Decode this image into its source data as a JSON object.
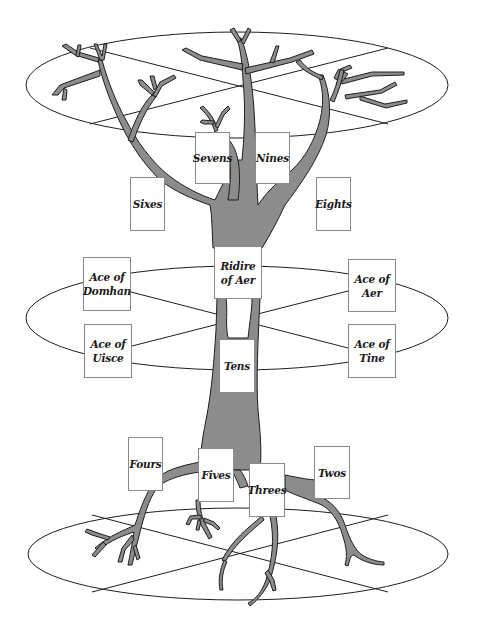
{
  "diagram": {
    "type": "tree-of-life-tarot-layout",
    "colors": {
      "tree_fill": "#8c8c8c",
      "tree_stroke": "#1e1e1e",
      "line": "#1e1e1e",
      "card_border": "#8a8a8a",
      "background": "#ffffff"
    },
    "planes": [
      {
        "name": "upper-plane",
        "cx": 237,
        "cy": 85,
        "rx": 211,
        "ry": 54
      },
      {
        "name": "middle-plane",
        "cx": 237,
        "cy": 318,
        "rx": 211,
        "ry": 53
      },
      {
        "name": "lower-plane",
        "cx": 238,
        "cy": 555,
        "rx": 210,
        "ry": 47
      }
    ],
    "cards": {
      "sevens": {
        "label": "Sevens",
        "x": 195,
        "y": 132,
        "w": 35,
        "h": 52
      },
      "nines": {
        "label": "Nines",
        "x": 255,
        "y": 132,
        "w": 35,
        "h": 52
      },
      "sixes": {
        "label": "Sixes",
        "x": 130,
        "y": 177,
        "w": 35,
        "h": 54
      },
      "eights": {
        "label": "Eights",
        "x": 316,
        "y": 177,
        "w": 35,
        "h": 54
      },
      "ridire_of_aer": {
        "label": "Ridire\nof Aer",
        "x": 214,
        "y": 246,
        "w": 48,
        "h": 53
      },
      "ace_of_domhan": {
        "label": "Ace of\nDomhan",
        "x": 83,
        "y": 257,
        "w": 48,
        "h": 54
      },
      "ace_of_aer": {
        "label": "Ace of\nAer",
        "x": 348,
        "y": 259,
        "w": 48,
        "h": 53
      },
      "ace_of_uisce": {
        "label": "Ace of\nUisce",
        "x": 84,
        "y": 324,
        "w": 48,
        "h": 54
      },
      "ace_of_tine": {
        "label": "Ace of\nTine",
        "x": 348,
        "y": 324,
        "w": 48,
        "h": 54
      },
      "tens": {
        "label": "Tens",
        "x": 219,
        "y": 339,
        "w": 36,
        "h": 54
      },
      "fours": {
        "label": "Fours",
        "x": 128,
        "y": 437,
        "w": 35,
        "h": 54
      },
      "fives": {
        "label": "Fives",
        "x": 198,
        "y": 448,
        "w": 36,
        "h": 54
      },
      "threes": {
        "label": "Threes",
        "x": 249,
        "y": 463,
        "w": 36,
        "h": 54
      },
      "twos": {
        "label": "Twos",
        "x": 314,
        "y": 446,
        "w": 36,
        "h": 53
      }
    }
  }
}
